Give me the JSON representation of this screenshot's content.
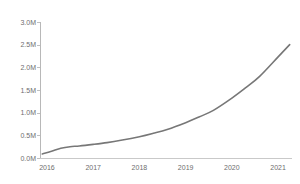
{
  "chart_data": {
    "type": "line",
    "title": "",
    "subtitle": "",
    "xlabel": "",
    "ylabel": "",
    "grid": false,
    "legend": false,
    "legend_position": "none",
    "line_color": "#777777",
    "line_width_px": 1.6,
    "background_color": "#ffffff",
    "axis_color": "#bdbdbd",
    "tick_label_color": "#6e6e6e",
    "xlim": [
      2015.85,
      2021.3
    ],
    "ylim": [
      0,
      3000000
    ],
    "y_tick_labels": [
      "0.0M",
      "0.5M",
      "1.0M",
      "1.5M",
      "2.0M",
      "2.5M",
      "3.0M"
    ],
    "y_tick_values": [
      0,
      500000,
      1000000,
      1500000,
      2000000,
      2500000,
      3000000
    ],
    "x_tick_labels": [
      "2016",
      "2017",
      "2018",
      "2019",
      "2020",
      "2021"
    ],
    "x_tick_values": [
      2016,
      2017,
      2018,
      2019,
      2020,
      2021
    ],
    "series": [
      {
        "name": "",
        "x": [
          2015.9,
          2016.1,
          2016.3,
          2016.5,
          2016.7,
          2017.0,
          2017.3,
          2017.6,
          2018.0,
          2018.3,
          2018.6,
          2019.0,
          2019.3,
          2019.6,
          2020.0,
          2020.3,
          2020.6,
          2021.0,
          2021.25
        ],
        "values": [
          90000,
          150000,
          215000,
          250000,
          265000,
          300000,
          340000,
          390000,
          470000,
          545000,
          630000,
          780000,
          910000,
          1050000,
          1320000,
          1550000,
          1800000,
          2230000,
          2500000
        ]
      }
    ]
  }
}
